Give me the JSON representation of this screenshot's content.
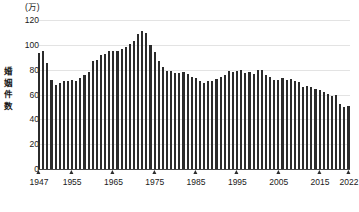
{
  "chart_data": {
    "type": "bar",
    "title": "",
    "subtitle": "",
    "unit_label": "(万)",
    "ylabel": "婚姻件数",
    "xlabel": "(年)",
    "ylim": [
      0,
      120
    ],
    "yticks": [
      0,
      20,
      40,
      60,
      80,
      100,
      120
    ],
    "ytick_labels": [
      "0",
      "20",
      "40",
      "60",
      "80",
      "100",
      "120"
    ],
    "grid": true,
    "grid_axis": "y",
    "legend": false,
    "bar_color": "#2b2b2b",
    "xtick_years": [
      1947,
      1955,
      1965,
      1975,
      1985,
      1995,
      2005,
      2015,
      2022
    ],
    "xtick_labels": [
      "1947",
      "1955",
      "1965",
      "1975",
      "1985",
      "1995",
      "2005",
      "2015",
      "2022"
    ],
    "x_start": 1947,
    "x_end": 2022,
    "categories": [
      1947,
      1948,
      1949,
      1950,
      1951,
      1952,
      1953,
      1954,
      1955,
      1956,
      1957,
      1958,
      1959,
      1960,
      1961,
      1962,
      1963,
      1964,
      1965,
      1966,
      1967,
      1968,
      1969,
      1970,
      1971,
      1972,
      1973,
      1974,
      1975,
      1976,
      1977,
      1978,
      1979,
      1980,
      1981,
      1982,
      1983,
      1984,
      1985,
      1986,
      1987,
      1988,
      1989,
      1990,
      1991,
      1992,
      1993,
      1994,
      1995,
      1996,
      1997,
      1998,
      1999,
      2000,
      2001,
      2002,
      2003,
      2004,
      2005,
      2006,
      2007,
      2008,
      2009,
      2010,
      2011,
      2012,
      2013,
      2014,
      2015,
      2016,
      2017,
      2018,
      2019,
      2020,
      2021,
      2022
    ],
    "values": [
      93.5,
      95.4,
      85.0,
      71.5,
      67.9,
      69.2,
      70.5,
      71.0,
      71.5,
      70.5,
      73.0,
      76.0,
      78.0,
      86.6,
      88.0,
      91.5,
      92.5,
      95.0,
      95.4,
      95.0,
      96.5,
      98.0,
      100.5,
      102.9,
      109.1,
      110.9,
      109.4,
      100.0,
      94.1,
      87.1,
      82.1,
      79.3,
      78.9,
      77.5,
      77.6,
      78.1,
      76.2,
      74.0,
      73.5,
      71.0,
      69.6,
      70.7,
      70.8,
      72.2,
      74.2,
      75.4,
      79.2,
      78.2,
      79.2,
      79.5,
      77.5,
      78.4,
      76.2,
      80.0,
      80.0,
      76.0,
      74.0,
      72.0,
      71.4,
      73.1,
      71.9,
      72.6,
      70.8,
      70.0,
      66.1,
      66.9,
      66.1,
      64.4,
      63.5,
      62.1,
      60.7,
      59.0,
      59.9,
      52.5,
      50.1,
      50.5
    ]
  }
}
